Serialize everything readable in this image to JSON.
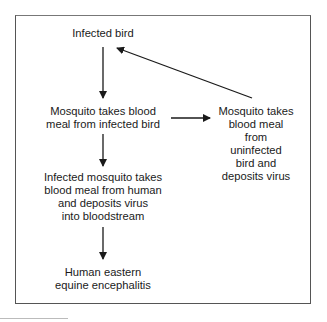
{
  "diagram": {
    "type": "flowchart",
    "nodes": [
      {
        "id": "infected_bird",
        "label": "Infected bird"
      },
      {
        "id": "mosquito_infected_bird",
        "label": "Mosquito takes blood\nmeal from infected bird"
      },
      {
        "id": "mosquito_uninfected_bird",
        "label": "Mosquito takes\nblood meal\nfrom\nuninfected\nbird and\ndeposits virus"
      },
      {
        "id": "infected_mosquito_human",
        "label": "Infected mosquito takes\nblood meal from human\nand deposits virus\ninto bloodstream"
      },
      {
        "id": "human_eee",
        "label": "Human eastern\nequine encephalitis"
      }
    ],
    "edges": [
      {
        "from": "infected_bird",
        "to": "mosquito_infected_bird"
      },
      {
        "from": "mosquito_infected_bird",
        "to": "mosquito_uninfected_bird"
      },
      {
        "from": "mosquito_uninfected_bird",
        "to": "infected_bird"
      },
      {
        "from": "mosquito_infected_bird",
        "to": "infected_mosquito_human"
      },
      {
        "from": "infected_mosquito_human",
        "to": "human_eee"
      }
    ],
    "colors": {
      "line": "#1a1a1a",
      "frame": "#555555"
    }
  }
}
